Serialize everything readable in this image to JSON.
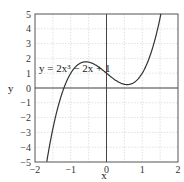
{
  "chart_data": {
    "type": "line",
    "title": "",
    "xlabel": "x",
    "ylabel": "y",
    "xlim": [
      -2,
      2
    ],
    "ylim": [
      -5,
      5
    ],
    "grid": true,
    "x_ticks": [
      "-2",
      "-1",
      "0",
      "1",
      "2"
    ],
    "y_ticks": [
      "5",
      "4",
      "3",
      "2",
      "1",
      "0",
      "-1",
      "-2",
      "-3",
      "-4",
      "-5"
    ],
    "series": [
      {
        "name": "y = 2x^3 - 2x + 1",
        "function": "2*x^3 - 2*x + 1",
        "x": [
          -1.6,
          -1.4,
          -1.2,
          -1.0,
          -0.8,
          -0.577,
          -0.4,
          -0.2,
          0,
          0.2,
          0.4,
          0.577,
          0.8,
          1.0,
          1.2,
          1.4,
          1.5
        ],
        "values": [
          -4.99,
          -1.69,
          0.14,
          1.0,
          1.58,
          1.77,
          1.67,
          1.38,
          1.0,
          0.62,
          0.33,
          0.23,
          0.42,
          1.0,
          2.06,
          3.69,
          4.75
        ]
      }
    ],
    "annotations": [
      {
        "text": "y = 2x³ − 2x + 1",
        "x": -1.8,
        "y": 2
      }
    ]
  },
  "labels": {
    "x_axis": "x",
    "y_axis": "y",
    "equation": "y = 2x³ − 2x + 1"
  }
}
